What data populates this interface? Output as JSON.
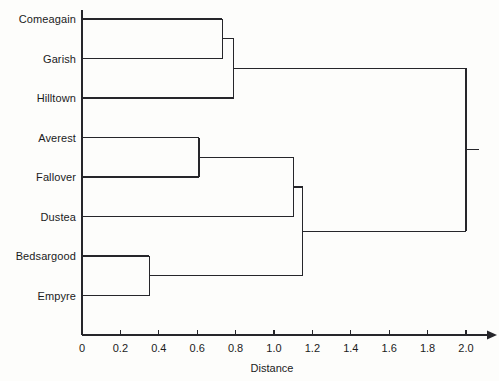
{
  "chart_data": {
    "type": "dendrogram",
    "title": "",
    "xlabel": "Distance",
    "ylabel": "",
    "xlim": [
      0,
      2.0
    ],
    "xticks": [
      0,
      0.2,
      0.4,
      0.6,
      0.8,
      1.0,
      1.2,
      1.4,
      1.6,
      1.8,
      2.0
    ],
    "xtick_labels": [
      "0",
      "0.2",
      "0.4",
      "0.6",
      "0.8",
      "1.0",
      "1.2",
      "1.4",
      "1.6",
      "1.8",
      "2.0"
    ],
    "grid": false,
    "legend": false,
    "orientation": "horizontal",
    "leaf_order": [
      "Comeagain",
      "Garish",
      "Hilltown",
      "Averest",
      "Fallover",
      "Dustea",
      "Bedsargood",
      "Empyre"
    ],
    "leaves": [
      {
        "label": "Comeagain",
        "index": 0
      },
      {
        "label": "Garish",
        "index": 1
      },
      {
        "label": "Hilltown",
        "index": 2
      },
      {
        "label": "Averest",
        "index": 3
      },
      {
        "label": "Fallover",
        "index": 4
      },
      {
        "label": "Dustea",
        "index": 5
      },
      {
        "label": "Bedsargood",
        "index": 6
      },
      {
        "label": "Empyre",
        "index": 7
      }
    ],
    "merges": [
      {
        "id": "m1",
        "children": [
          "Bedsargood",
          "Empyre"
        ],
        "distance": 0.35
      },
      {
        "id": "m2",
        "children": [
          "Averest",
          "Fallover"
        ],
        "distance": 0.61
      },
      {
        "id": "m3",
        "children": [
          "Comeagain",
          "Garish"
        ],
        "distance": 0.73
      },
      {
        "id": "m4",
        "children": [
          "m3",
          "Hilltown"
        ],
        "distance": 0.79
      },
      {
        "id": "m5",
        "children": [
          "m2",
          "Dustea"
        ],
        "distance": 1.1
      },
      {
        "id": "m6",
        "children": [
          "m5",
          "m1"
        ],
        "distance": 1.15
      },
      {
        "id": "m7",
        "children": [
          "m4",
          "m6"
        ],
        "distance": 2.0
      }
    ],
    "line_color": "#26262a",
    "axis_color": "#26262a",
    "background_color": "#fdfdfb"
  },
  "axis": {
    "title": "Distance"
  }
}
